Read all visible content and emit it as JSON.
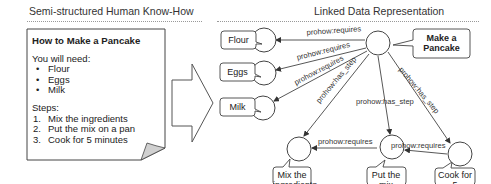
{
  "left_section": {
    "title": "Semi-structured Human Know-How",
    "document": {
      "title": "How to Make a Pancake",
      "needs_heading": "You will need:",
      "ingredients": [
        "Flour",
        "Eggs",
        "Milk"
      ],
      "steps_heading": "Steps:",
      "steps": [
        {
          "num": "1.",
          "text": "Mix the ingredients"
        },
        {
          "num": "2.",
          "text": "Put the mix on a pan"
        },
        {
          "num": "3.",
          "text": "Cook for 5 minutes"
        }
      ]
    }
  },
  "right_section": {
    "title": "Linked Data Representation",
    "nodes": {
      "main": "Make a Pancake",
      "flour": "Flour",
      "eggs": "Eggs",
      "milk": "Milk",
      "step1": "Mix the ingredients",
      "step2": "Put the mix on a pan",
      "step3": "Cook for 5 minutes"
    },
    "node_lines": {
      "main": [
        "Make a",
        "Pancake"
      ],
      "step1": [
        "Mix the",
        "ingredients"
      ],
      "step2": [
        "Put the mix",
        "on a pan"
      ],
      "step3": [
        "Cook for 5",
        "minutes"
      ]
    },
    "edges": [
      {
        "from": "main",
        "to": "flour",
        "label": "prohow:requires"
      },
      {
        "from": "main",
        "to": "eggs",
        "label": "prohow:requires"
      },
      {
        "from": "main",
        "to": "milk",
        "label": "prohow:requires"
      },
      {
        "from": "main",
        "to": "step1",
        "label": "prohow:has_step"
      },
      {
        "from": "main",
        "to": "step2",
        "label": "prohow:has_step"
      },
      {
        "from": "main",
        "to": "step3",
        "label": "prohow:has_step"
      },
      {
        "from": "step2",
        "to": "step1",
        "label": "prohow:requires"
      },
      {
        "from": "step3",
        "to": "step2",
        "label": "prohow:requires"
      }
    ]
  }
}
